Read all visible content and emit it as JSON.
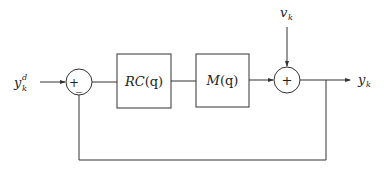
{
  "diagram": {
    "type": "feedback-control-block-diagram",
    "input": {
      "label_base": "y",
      "label_sub": "k",
      "label_sup": "d"
    },
    "disturbance": {
      "label_base": "v",
      "label_sub": "k"
    },
    "output": {
      "label_base": "y",
      "label_sub": "k"
    },
    "summing_junction_1": {
      "plus_sign": "+",
      "minus_sign": "_"
    },
    "summing_junction_2": {
      "plus_sign": "+"
    },
    "blocks": [
      {
        "id": "controller",
        "label_a": "RC",
        "label_b": "(q)"
      },
      {
        "id": "plant",
        "label_a": "M",
        "label_b": "(q)"
      }
    ],
    "connections": [
      "input -> summing_junction_1 (+)",
      "summing_junction_1 -> controller",
      "controller -> plant",
      "plant -> summing_junction_2",
      "disturbance -> summing_junction_2",
      "summing_junction_2 -> output",
      "output -> summing_junction_1 (-) [feedback]"
    ],
    "colors": {
      "stroke": "#333333",
      "background": "#ffffff"
    }
  }
}
